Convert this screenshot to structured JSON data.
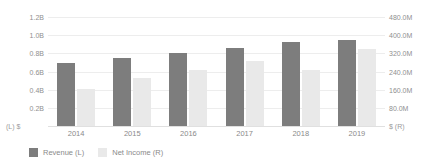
{
  "chart_data": {
    "type": "bar",
    "title": "",
    "subtitle": "",
    "xlabel": "",
    "categories": [
      "2014",
      "2015",
      "2016",
      "2017",
      "2018",
      "2019"
    ],
    "grid": true,
    "legend_position": "bottom-left",
    "series": [
      {
        "name": "Revenue (L)",
        "axis": "left",
        "unit": "$B",
        "color": "#7d7d7d",
        "values": [
          0.69,
          0.75,
          0.8,
          0.86,
          0.93,
          0.95
        ]
      },
      {
        "name": "Net Income (R)",
        "axis": "right",
        "unit": "$M",
        "color": "#e9e9e9",
        "values": [
          162,
          212,
          245,
          285,
          245,
          340
        ]
      }
    ],
    "left_axis": {
      "label": "(L) $",
      "ylim": [
        0,
        1.2
      ],
      "ticks": [
        1.2,
        1.0,
        0.8,
        0.6,
        0.4,
        0.2
      ],
      "tick_labels": [
        "1.2B",
        "1.0B",
        "0.8B",
        "0.6B",
        "0.4B",
        "0.2B"
      ]
    },
    "right_axis": {
      "label": "$ (R)",
      "ylim": [
        0,
        480
      ],
      "ticks": [
        480,
        400,
        320,
        240,
        160,
        80
      ],
      "tick_labels": [
        "480.0M",
        "400.0M",
        "320.0M",
        "240.0M",
        "160.0M",
        "80.0M"
      ]
    }
  },
  "legend": {
    "items": [
      {
        "label": "Revenue (L)",
        "color": "#7d7d7d"
      },
      {
        "label": "Net Income (R)",
        "color": "#e9e9e9"
      }
    ]
  },
  "colors": {
    "background": "#ffffff",
    "grid": "#ededed",
    "baseline": "#e0e0e0",
    "text": "#8a8a8a",
    "revenue": "#7d7d7d",
    "net_income": "#e9e9e9"
  }
}
